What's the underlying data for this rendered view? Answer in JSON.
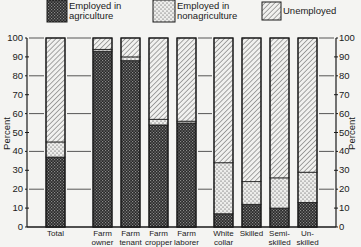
{
  "chart_data": {
    "type": "bar",
    "stacked": true,
    "title": "",
    "xlabel": "",
    "ylabel": "Percent",
    "ylim": [
      0,
      100
    ],
    "yticks": [
      0,
      10,
      20,
      30,
      40,
      50,
      60,
      70,
      80,
      90,
      100
    ],
    "grid": "partial guide lines at 20, 40, 60, 80, 100 between bar groups",
    "legend_position": "top",
    "categories": [
      "Total",
      "Farm owner",
      "Farm tenant",
      "Farm cropper",
      "Farm laborer",
      "White collar",
      "Skilled",
      "Semi-skilled",
      "Un-skilled"
    ],
    "category_labels": [
      "Total",
      "Farm\nowner",
      "Farm\ntenant",
      "Farm\ncropper",
      "Farm\nlaborer",
      "White\ncollar",
      "Skilled",
      "Semi-\nskilled",
      "Un-\nskilled"
    ],
    "series": [
      {
        "name": "Employed in agriculture",
        "legend_label": "Employed in\nagriculture",
        "pattern": "crosshatch-dark",
        "values": [
          37,
          93,
          88,
          54,
          55,
          7,
          12,
          10,
          13
        ]
      },
      {
        "name": "Employed in nonagriculture",
        "legend_label": "Employed in\nnonagriculture",
        "pattern": "dots-light",
        "values": [
          8,
          1,
          2,
          3,
          1,
          27,
          12,
          16,
          16
        ]
      },
      {
        "name": "Unemployed",
        "legend_label": "Unemployed",
        "pattern": "diagonal-hatch",
        "values": [
          55,
          6,
          10,
          43,
          44,
          66,
          76,
          74,
          71
        ]
      }
    ]
  },
  "axis": {
    "left_label": "Percent",
    "right_label": "Percent",
    "tick_labels": [
      "0",
      "10",
      "20",
      "30",
      "40",
      "50",
      "60",
      "70",
      "80",
      "90",
      "100"
    ]
  },
  "colors": {
    "ink": "#1a1a1a",
    "paper": "#f4f4f2"
  }
}
